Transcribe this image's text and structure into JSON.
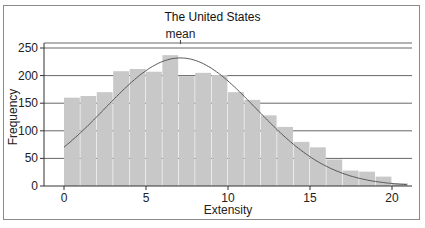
{
  "chart_data": {
    "type": "bar",
    "title": "The United States",
    "xlabel": "Extensity",
    "ylabel": "Frequency",
    "annotation": "mean",
    "mean_x": 7.1,
    "bin_width": 1,
    "bin_starts": [
      0,
      1,
      2,
      3,
      4,
      5,
      6,
      7,
      8,
      9,
      10,
      11,
      12,
      13,
      14,
      15,
      16,
      17,
      18,
      19,
      20
    ],
    "values": [
      160,
      163,
      170,
      208,
      212,
      207,
      237,
      199,
      205,
      201,
      170,
      156,
      128,
      107,
      80,
      70,
      48,
      28,
      26,
      17,
      5
    ],
    "overlay": {
      "type": "normal-curve",
      "peak": 232,
      "mean": 7.1,
      "sd": 4.6
    },
    "x_ticks": [
      0,
      5,
      10,
      15,
      20
    ],
    "y_ticks": [
      0,
      50,
      100,
      150,
      200,
      250
    ],
    "xlim": [
      -1.2,
      21.5
    ],
    "ylim": [
      0,
      260
    ],
    "grid": "horizontal",
    "legend": "none",
    "colors": {
      "bar": "#c8c8c8",
      "curve": "#555555",
      "grid": "#666666"
    }
  }
}
